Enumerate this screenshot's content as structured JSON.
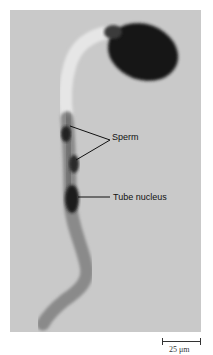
{
  "figure": {
    "labels": [
      {
        "text": "Sperm",
        "x": 99,
        "y": 132
      },
      {
        "text": "Tube nucleus",
        "x": 102,
        "y": 193
      }
    ],
    "scale_bar": {
      "text": "25 μm",
      "length_px": 38
    },
    "colors": {
      "background": "#c9c9c9",
      "pollen_grain": "#1a1a1a",
      "tube": "#9a9a9a",
      "nuclei": "#2a2a2a"
    }
  }
}
